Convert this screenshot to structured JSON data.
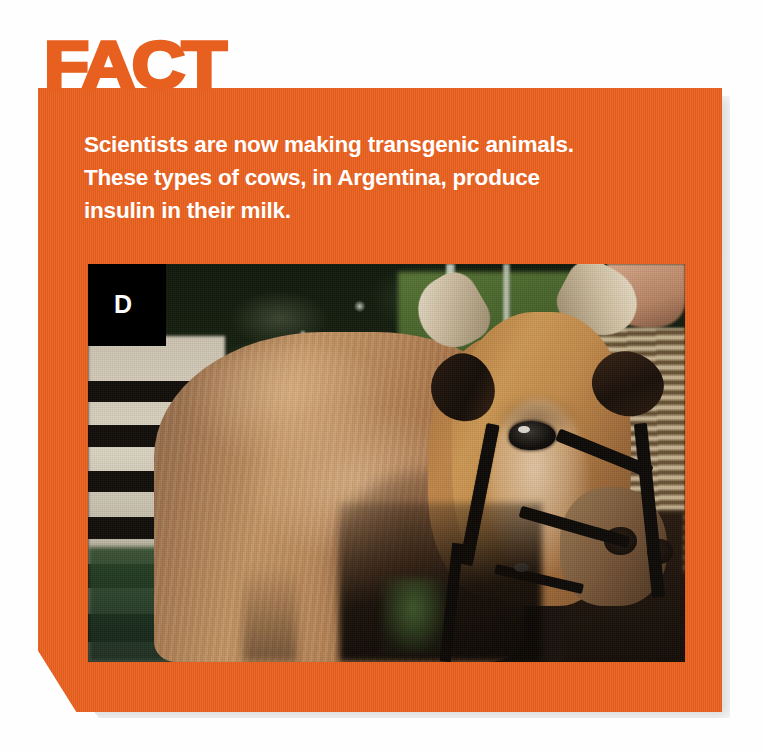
{
  "card": {
    "kicker": "FACT",
    "accent_color": "#e8601f",
    "text_color": "#ffffff",
    "body_lines": [
      "Scientists are now making transgenic animals.",
      "These types of cows, in Argentina, produce",
      "insulin in their milk."
    ],
    "body_text": "Scientists are now making transgenic animals. These types of cows, in Argentina, produce insulin in their milk."
  },
  "figure": {
    "panel_letter": "D",
    "panel_letter_bg": "#000000",
    "caption_alt": "Brown Jersey cow wearing a halter, standing in front of a dark wooden fence with green foliage behind",
    "icons": {
      "cow": "cow-icon"
    }
  }
}
